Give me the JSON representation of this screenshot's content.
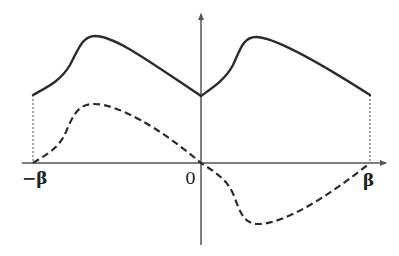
{
  "diagram": {
    "labels": {
      "neg_beta": "−β",
      "origin": "0",
      "beta": "β"
    },
    "colors": {
      "axis": "#555555",
      "solid_curve": "#2b2b2b",
      "dashed_curve": "#2b2b2b",
      "guide": "#555555",
      "background": "#ffffff"
    },
    "curves": {
      "solid": {
        "style": "solid",
        "description": "Periodic hump: starts at -β at mid height, rises to peak, descends linearly to a cusp at 0, repeats on [0, β]"
      },
      "dashed": {
        "style": "dashed",
        "description": "Odd function: zero at -β, positive hump on (-β,0), zero at 0, negative trough on (0,β), zero at β"
      }
    }
  }
}
